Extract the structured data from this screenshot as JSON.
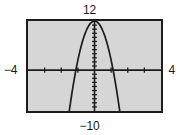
{
  "figure": {
    "name": "graphing-calculator-window",
    "background_color": "#ffffff",
    "plot_background_color": "#d6d6d6",
    "frame_color": "#1c1c1c",
    "curve_color": "#1c1c1c",
    "axis_color": "#1c1c1c"
  },
  "window_labels": {
    "ymax": "12",
    "ymin": "−10",
    "xmin": "−4",
    "xmax": "4"
  },
  "chart_data": {
    "type": "line",
    "title": "",
    "subtitle": "",
    "xlabel": "",
    "ylabel": "",
    "xlim": [
      -4,
      4
    ],
    "ylim": [
      -10,
      12
    ],
    "grid": false,
    "legend": null,
    "axes": {
      "x_axis_at_y": 0,
      "y_axis_at_x": 0,
      "x_tick_spacing": 1,
      "y_tick_spacing": 1,
      "x_tick_values": [
        -4,
        -3,
        -2,
        -1,
        0,
        1,
        2,
        3,
        4
      ],
      "y_tick_values": [
        -10,
        -9,
        -8,
        -7,
        -6,
        -5,
        -4,
        -3,
        -2,
        -1,
        0,
        1,
        2,
        3,
        4,
        5,
        6,
        7,
        8,
        9,
        10,
        11,
        12
      ]
    },
    "annotations": [
      {
        "name": "ymax-label",
        "text": "12",
        "position": "top-center"
      },
      {
        "name": "ymin-label",
        "text": "−10",
        "position": "bottom-center"
      },
      {
        "name": "xmin-label",
        "text": "−4",
        "position": "left-middle"
      },
      {
        "name": "xmax-label",
        "text": "4",
        "position": "right-middle"
      }
    ],
    "series": [
      {
        "name": "parabola",
        "shape": "downward-parabola",
        "vertex": [
          0,
          12
        ],
        "x_intercepts": [
          -1.12,
          1.12
        ],
        "x": [
          -2.2,
          -2.0,
          -1.8,
          -1.6,
          -1.4,
          -1.2,
          -1.0,
          -0.8,
          -0.6,
          -0.4,
          -0.2,
          0.0,
          0.2,
          0.4,
          0.6,
          0.8,
          1.0,
          1.2,
          1.4,
          1.6,
          1.8,
          2.0,
          2.2
        ],
        "values": [
          -34.4,
          -26.0,
          -18.4,
          -12.6,
          -6.8,
          -2.2,
          2.4,
          5.9,
          8.6,
          10.4,
          11.6,
          12.0,
          11.6,
          10.4,
          8.6,
          5.9,
          2.4,
          -2.2,
          -6.8,
          -12.6,
          -18.4,
          -26.0,
          -34.4
        ]
      }
    ]
  }
}
